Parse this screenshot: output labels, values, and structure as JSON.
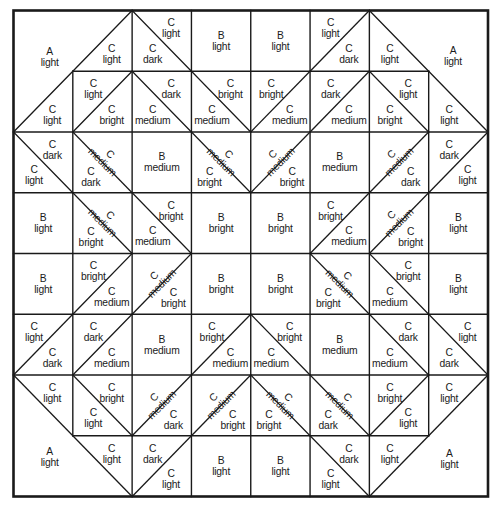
{
  "diagram": {
    "kind": "quilt-block-piecing-diagram",
    "colors": {
      "line": "#1a1a1a",
      "text": "#1a1a1a",
      "background": "#ffffff"
    },
    "grid": {
      "rows": 8,
      "cols": 8
    },
    "corner_patches": [
      {
        "corner": "top-left",
        "fabric": "A",
        "value": "light"
      },
      {
        "corner": "top-right",
        "fabric": "A",
        "value": "light"
      },
      {
        "corner": "bottom-left",
        "fabric": "A",
        "value": "light"
      },
      {
        "corner": "bottom-right",
        "fabric": "A",
        "value": "light"
      }
    ],
    "cells": [
      {
        "r": 1,
        "c": 2,
        "half": true,
        "diagonal": "bltr",
        "lower": {
          "fabric": "C",
          "value": "light"
        }
      },
      {
        "r": 1,
        "c": 3,
        "diagonal": "tlbr",
        "upper": {
          "fabric": "C",
          "value": "light"
        },
        "lower": {
          "fabric": "C",
          "value": "dark"
        }
      },
      {
        "r": 1,
        "c": 4,
        "plain": {
          "fabric": "B",
          "value": "light"
        }
      },
      {
        "r": 1,
        "c": 5,
        "plain": {
          "fabric": "B",
          "value": "light"
        }
      },
      {
        "r": 1,
        "c": 6,
        "diagonal": "bltr",
        "upper": {
          "fabric": "C",
          "value": "light"
        },
        "lower": {
          "fabric": "C",
          "value": "dark"
        }
      },
      {
        "r": 1,
        "c": 7,
        "half": true,
        "diagonal": "tlbr",
        "lower": {
          "fabric": "C",
          "value": "light"
        }
      },
      {
        "r": 2,
        "c": 1,
        "half": true,
        "diagonal": "bltr",
        "lower": {
          "fabric": "C",
          "value": "light"
        }
      },
      {
        "r": 2,
        "c": 2,
        "diagonal": "bltr",
        "upper": {
          "fabric": "C",
          "value": "light"
        },
        "lower": {
          "fabric": "C",
          "value": "bright"
        }
      },
      {
        "r": 2,
        "c": 3,
        "diagonal": "tlbr",
        "upper": {
          "fabric": "C",
          "value": "dark"
        },
        "lower": {
          "fabric": "C",
          "value": "medium"
        }
      },
      {
        "r": 2,
        "c": 4,
        "diagonal": "tlbr",
        "upper": {
          "fabric": "C",
          "value": "bright"
        },
        "lower": {
          "fabric": "C",
          "value": "medium"
        }
      },
      {
        "r": 2,
        "c": 5,
        "diagonal": "bltr",
        "upper": {
          "fabric": "C",
          "value": "bright"
        },
        "lower": {
          "fabric": "C",
          "value": "medium"
        }
      },
      {
        "r": 2,
        "c": 6,
        "diagonal": "bltr",
        "upper": {
          "fabric": "C",
          "value": "dark"
        },
        "lower": {
          "fabric": "C",
          "value": "medium"
        }
      },
      {
        "r": 2,
        "c": 7,
        "diagonal": "tlbr",
        "upper": {
          "fabric": "C",
          "value": "light"
        },
        "lower": {
          "fabric": "C",
          "value": "bright"
        }
      },
      {
        "r": 2,
        "c": 8,
        "half": true,
        "diagonal": "tlbr",
        "lower": {
          "fabric": "C",
          "value": "light"
        }
      },
      {
        "r": 3,
        "c": 1,
        "diagonal": "tlbr",
        "upper": {
          "fabric": "C",
          "value": "dark"
        },
        "lower": {
          "fabric": "C",
          "value": "light"
        }
      },
      {
        "r": 3,
        "c": 2,
        "diagonal": "tlbr",
        "upper": {
          "fabric": "C",
          "value": "medium",
          "rotated": true
        },
        "lower": {
          "fabric": "C",
          "value": "dark"
        }
      },
      {
        "r": 3,
        "c": 3,
        "plain": {
          "fabric": "B",
          "value": "medium"
        }
      },
      {
        "r": 3,
        "c": 4,
        "diagonal": "tlbr",
        "upper": {
          "fabric": "C",
          "value": "medium",
          "rotated": true
        },
        "lower": {
          "fabric": "C",
          "value": "bright"
        }
      },
      {
        "r": 3,
        "c": 5,
        "diagonal": "bltr",
        "upper": {
          "fabric": "C",
          "value": "medium",
          "rotated": true
        },
        "lower": {
          "fabric": "C",
          "value": "bright"
        }
      },
      {
        "r": 3,
        "c": 6,
        "plain": {
          "fabric": "B",
          "value": "medium"
        }
      },
      {
        "r": 3,
        "c": 7,
        "diagonal": "bltr",
        "upper": {
          "fabric": "C",
          "value": "medium",
          "rotated": true
        },
        "lower": {
          "fabric": "C",
          "value": "dark"
        }
      },
      {
        "r": 3,
        "c": 8,
        "diagonal": "bltr",
        "upper": {
          "fabric": "C",
          "value": "dark"
        },
        "lower": {
          "fabric": "C",
          "value": "light"
        }
      },
      {
        "r": 4,
        "c": 1,
        "plain": {
          "fabric": "B",
          "value": "light"
        }
      },
      {
        "r": 4,
        "c": 2,
        "diagonal": "tlbr",
        "upper": {
          "fabric": "C",
          "value": "medium",
          "rotated": true
        },
        "lower": {
          "fabric": "C",
          "value": "bright"
        }
      },
      {
        "r": 4,
        "c": 3,
        "diagonal": "tlbr",
        "upper": {
          "fabric": "C",
          "value": "bright"
        },
        "lower": {
          "fabric": "C",
          "value": "medium"
        }
      },
      {
        "r": 4,
        "c": 4,
        "plain": {
          "fabric": "B",
          "value": "bright"
        }
      },
      {
        "r": 4,
        "c": 5,
        "plain": {
          "fabric": "B",
          "value": "bright"
        }
      },
      {
        "r": 4,
        "c": 6,
        "diagonal": "bltr",
        "upper": {
          "fabric": "C",
          "value": "bright"
        },
        "lower": {
          "fabric": "C",
          "value": "medium"
        }
      },
      {
        "r": 4,
        "c": 7,
        "diagonal": "bltr",
        "upper": {
          "fabric": "C",
          "value": "medium",
          "rotated": true
        },
        "lower": {
          "fabric": "C",
          "value": "bright"
        }
      },
      {
        "r": 4,
        "c": 8,
        "plain": {
          "fabric": "B",
          "value": "light"
        }
      },
      {
        "r": 5,
        "c": 1,
        "plain": {
          "fabric": "B",
          "value": "light"
        }
      },
      {
        "r": 5,
        "c": 2,
        "diagonal": "bltr",
        "upper": {
          "fabric": "C",
          "value": "bright"
        },
        "lower": {
          "fabric": "C",
          "value": "medium"
        }
      },
      {
        "r": 5,
        "c": 3,
        "diagonal": "bltr",
        "upper": {
          "fabric": "C",
          "value": "medium",
          "rotated": true
        },
        "lower": {
          "fabric": "C",
          "value": "bright"
        }
      },
      {
        "r": 5,
        "c": 4,
        "plain": {
          "fabric": "B",
          "value": "bright"
        }
      },
      {
        "r": 5,
        "c": 5,
        "plain": {
          "fabric": "B",
          "value": "bright"
        }
      },
      {
        "r": 5,
        "c": 6,
        "diagonal": "tlbr",
        "upper": {
          "fabric": "C",
          "value": "medium",
          "rotated": true
        },
        "lower": {
          "fabric": "C",
          "value": "bright"
        }
      },
      {
        "r": 5,
        "c": 7,
        "diagonal": "tlbr",
        "upper": {
          "fabric": "C",
          "value": "bright"
        },
        "lower": {
          "fabric": "C",
          "value": "medium"
        }
      },
      {
        "r": 5,
        "c": 8,
        "plain": {
          "fabric": "B",
          "value": "light"
        }
      },
      {
        "r": 6,
        "c": 1,
        "diagonal": "bltr",
        "upper": {
          "fabric": "C",
          "value": "light"
        },
        "lower": {
          "fabric": "C",
          "value": "dark"
        }
      },
      {
        "r": 6,
        "c": 2,
        "diagonal": "bltr",
        "upper": {
          "fabric": "C",
          "value": "dark"
        },
        "lower": {
          "fabric": "C",
          "value": "medium"
        }
      },
      {
        "r": 6,
        "c": 3,
        "plain": {
          "fabric": "B",
          "value": "medium"
        }
      },
      {
        "r": 6,
        "c": 4,
        "diagonal": "bltr",
        "upper": {
          "fabric": "C",
          "value": "bright"
        },
        "lower": {
          "fabric": "C",
          "value": "medium"
        }
      },
      {
        "r": 6,
        "c": 5,
        "diagonal": "tlbr",
        "upper": {
          "fabric": "C",
          "value": "bright"
        },
        "lower": {
          "fabric": "C",
          "value": "medium"
        }
      },
      {
        "r": 6,
        "c": 6,
        "plain": {
          "fabric": "B",
          "value": "medium"
        }
      },
      {
        "r": 6,
        "c": 7,
        "diagonal": "tlbr",
        "upper": {
          "fabric": "C",
          "value": "dark"
        },
        "lower": {
          "fabric": "C",
          "value": "medium"
        }
      },
      {
        "r": 6,
        "c": 8,
        "diagonal": "tlbr",
        "upper": {
          "fabric": "C",
          "value": "light"
        },
        "lower": {
          "fabric": "C",
          "value": "dark"
        }
      },
      {
        "r": 7,
        "c": 1,
        "half": true,
        "diagonal": "tlbr",
        "upper": {
          "fabric": "C",
          "value": "light"
        }
      },
      {
        "r": 7,
        "c": 2,
        "diagonal": "tlbr",
        "upper": {
          "fabric": "C",
          "value": "bright"
        },
        "lower": {
          "fabric": "C",
          "value": "light"
        }
      },
      {
        "r": 7,
        "c": 3,
        "diagonal": "bltr",
        "upper": {
          "fabric": "C",
          "value": "medium",
          "rotated": true
        },
        "lower": {
          "fabric": "C",
          "value": "dark"
        }
      },
      {
        "r": 7,
        "c": 4,
        "diagonal": "bltr",
        "upper": {
          "fabric": "C",
          "value": "medium",
          "rotated": true
        },
        "lower": {
          "fabric": "C",
          "value": "bright"
        }
      },
      {
        "r": 7,
        "c": 5,
        "diagonal": "tlbr",
        "upper": {
          "fabric": "C",
          "value": "medium",
          "rotated": true
        },
        "lower": {
          "fabric": "C",
          "value": "bright"
        }
      },
      {
        "r": 7,
        "c": 6,
        "diagonal": "tlbr",
        "upper": {
          "fabric": "C",
          "value": "medium",
          "rotated": true
        },
        "lower": {
          "fabric": "C",
          "value": "dark"
        }
      },
      {
        "r": 7,
        "c": 7,
        "diagonal": "bltr",
        "upper": {
          "fabric": "C",
          "value": "bright"
        },
        "lower": {
          "fabric": "C",
          "value": "light"
        }
      },
      {
        "r": 7,
        "c": 8,
        "half": true,
        "diagonal": "bltr",
        "upper": {
          "fabric": "C",
          "value": "light"
        }
      },
      {
        "r": 8,
        "c": 2,
        "half": true,
        "diagonal": "tlbr",
        "upper": {
          "fabric": "C",
          "value": "light"
        }
      },
      {
        "r": 8,
        "c": 3,
        "diagonal": "bltr",
        "upper": {
          "fabric": "C",
          "value": "dark"
        },
        "lower": {
          "fabric": "C",
          "value": "light"
        }
      },
      {
        "r": 8,
        "c": 4,
        "plain": {
          "fabric": "B",
          "value": "light"
        }
      },
      {
        "r": 8,
        "c": 5,
        "plain": {
          "fabric": "B",
          "value": "light"
        }
      },
      {
        "r": 8,
        "c": 6,
        "diagonal": "tlbr",
        "upper": {
          "fabric": "C",
          "value": "dark"
        },
        "lower": {
          "fabric": "C",
          "value": "light"
        }
      },
      {
        "r": 8,
        "c": 7,
        "half": true,
        "diagonal": "bltr",
        "upper": {
          "fabric": "C",
          "value": "light"
        }
      }
    ]
  }
}
